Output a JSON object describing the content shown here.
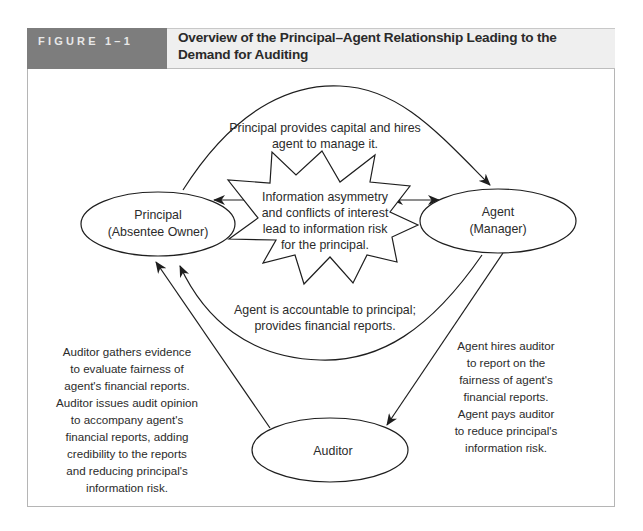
{
  "figure": {
    "label": "FIGURE 1–1",
    "title": "Overview of the Principal–Agent Relationship Leading to the Demand for Auditing"
  },
  "nodes": {
    "principal": {
      "line1": "Principal",
      "line2": "(Absentee Owner)"
    },
    "agent": {
      "line1": "Agent",
      "line2": "(Manager)"
    },
    "auditor": {
      "line1": "Auditor"
    },
    "starburst": {
      "lines": [
        "Information asymmetry",
        "and conflicts of interest",
        "lead to information risk",
        "for the principal."
      ]
    }
  },
  "edges": {
    "principal_to_agent": {
      "lines": [
        "Principal provides capital and hires",
        "agent to manage it."
      ]
    },
    "agent_to_principal": {
      "lines": [
        "Agent is accountable to principal;",
        "provides financial reports."
      ]
    },
    "agent_to_auditor": {
      "lines": [
        "Agent hires auditor",
        "to report on the",
        "fairness of agent's",
        "financial reports.",
        "Agent pays auditor",
        "to reduce principal's",
        "information risk."
      ]
    },
    "auditor_to_principal": {
      "lines": [
        "Auditor gathers evidence",
        "to evaluate fairness of",
        "agent's financial reports.",
        "Auditor issues audit opinion",
        "to accompany agent's",
        "financial reports, adding",
        "credibility to the reports",
        "and reducing principal's",
        "information risk."
      ]
    }
  },
  "colors": {
    "label_bg": "#7d7d7d",
    "title_bg": "#efefef",
    "stroke": "#1e1e1e"
  }
}
